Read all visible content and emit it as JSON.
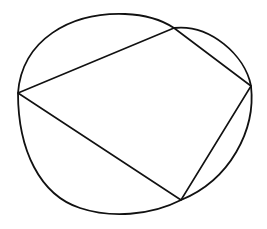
{
  "diagram": {
    "type": "cyclic-quadrilateral",
    "colors": {
      "stroke": "#111111",
      "background": "#ffffff"
    },
    "circle": {
      "cx": 134,
      "cy": 113,
      "rx": 117,
      "ry": 100
    },
    "vertices": [
      {
        "name": "left",
        "x": 18,
        "y": 93
      },
      {
        "name": "top-right",
        "x": 174,
        "y": 28
      },
      {
        "name": "right",
        "x": 251,
        "y": 86
      },
      {
        "name": "bottom",
        "x": 181,
        "y": 200
      }
    ]
  }
}
